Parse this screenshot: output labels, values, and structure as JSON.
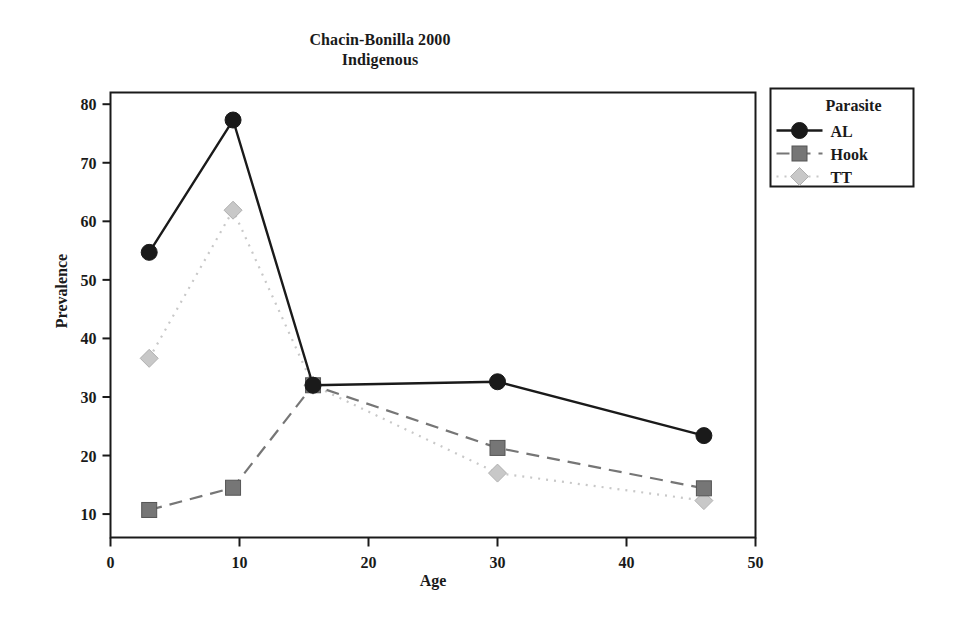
{
  "chart_data": {
    "type": "line",
    "title": "Chacin-Bonilla 2000",
    "subtitle": "Indigenous",
    "xlabel": "Age",
    "ylabel": "Prevalence",
    "xlim": [
      0,
      50
    ],
    "ylim": [
      6,
      82
    ],
    "grid": false,
    "xticks": [
      "0",
      "10",
      "20",
      "30",
      "40",
      "50"
    ],
    "xtick_values": [
      0,
      10,
      20,
      30,
      40,
      50
    ],
    "yticks": [
      "10",
      "20",
      "30",
      "40",
      "50",
      "60",
      "70",
      "80"
    ],
    "ytick_values": [
      10,
      20,
      30,
      40,
      50,
      60,
      70,
      80
    ],
    "legend": {
      "title": "Parasite",
      "position": "right-outside",
      "entries": [
        {
          "label": "AL",
          "marker": "circle",
          "line": "solid",
          "color": "#1a1a1a"
        },
        {
          "label": "Hook",
          "marker": "square",
          "line": "dashed",
          "color": "#767676"
        },
        {
          "label": "TT",
          "marker": "diamond",
          "line": "dotted",
          "color": "#c8c8c8"
        }
      ]
    },
    "series": [
      {
        "name": "AL",
        "marker": "circle",
        "line": "solid",
        "color": "#1a1a1a",
        "x": [
          3.0,
          9.5,
          15.7,
          30.0,
          46.0
        ],
        "y": [
          54.7,
          77.3,
          32.0,
          32.6,
          23.4
        ]
      },
      {
        "name": "Hook",
        "marker": "square",
        "line": "dashed",
        "color": "#767676",
        "x": [
          3.0,
          9.5,
          15.7,
          30.0,
          46.0
        ],
        "y": [
          10.7,
          14.5,
          32.0,
          21.3,
          14.4
        ]
      },
      {
        "name": "TT",
        "marker": "diamond",
        "line": "dotted",
        "color": "#c8c8c8",
        "x": [
          3.0,
          9.5,
          15.7,
          30.0,
          46.0
        ],
        "y": [
          36.6,
          61.9,
          32.0,
          17.0,
          12.3
        ]
      }
    ]
  }
}
